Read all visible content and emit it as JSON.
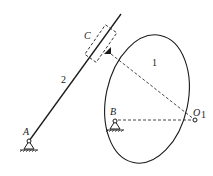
{
  "diagram": {
    "type": "cam-follower mechanism",
    "labels": {
      "A": "A",
      "B": "B",
      "C": "C",
      "O1": "O",
      "O1_sub": "1",
      "part1": "1",
      "part2": "2"
    },
    "colors": {
      "stroke": "#1a1a1a",
      "background": "#ffffff"
    }
  }
}
